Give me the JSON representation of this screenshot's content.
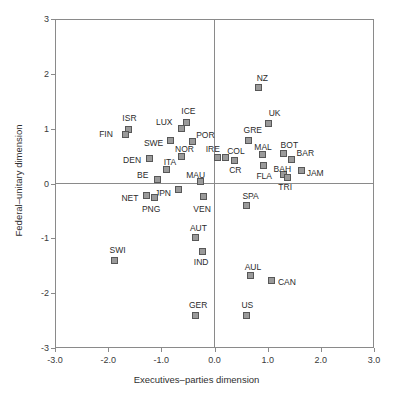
{
  "chart_data": {
    "type": "scatter",
    "title": "",
    "xlabel": "Executives–parties dimension",
    "ylabel": "Federal–unitary dimension",
    "xlim": [
      -3.0,
      3.0
    ],
    "ylim": [
      -3.0,
      3.0
    ],
    "xticks": [
      "-3.0",
      "-2.0",
      "-1.0",
      "0.0",
      "1.0",
      "2.0",
      "3.0"
    ],
    "xtick_values": [
      -3.0,
      -2.0,
      -1.0,
      0.0,
      1.0,
      2.0,
      3.0
    ],
    "yticks": [
      "3",
      "2",
      "1",
      "0",
      "-1",
      "-2",
      "-3"
    ],
    "ytick_values": [
      3,
      2,
      1,
      0,
      -1,
      -2,
      -3
    ],
    "grid": false,
    "legend": "none",
    "marker": {
      "shape": "square",
      "fill": "#9a9a9a",
      "edge": "#575757"
    },
    "reference_lines": {
      "horizontal": 0.0,
      "vertical": 0.0
    },
    "points": [
      {
        "label": "NZ",
        "x": 0.83,
        "y": 1.75,
        "lx": -2,
        "ly": -14
      },
      {
        "label": "UK",
        "x": 1.02,
        "y": 1.1,
        "lx": 0,
        "ly": -14
      },
      {
        "label": "ISR",
        "x": -1.62,
        "y": 0.99,
        "lx": -6,
        "ly": -15
      },
      {
        "label": "FIN",
        "x": -1.68,
        "y": 0.9,
        "lx": -26,
        "ly": -4
      },
      {
        "label": "ICE",
        "x": -0.53,
        "y": 1.12,
        "lx": -5,
        "ly": -15
      },
      {
        "label": "LUX",
        "x": -0.63,
        "y": 1.01,
        "lx": -25,
        "ly": -10
      },
      {
        "label": "POR",
        "x": -0.42,
        "y": 0.76,
        "lx": 4,
        "ly": -11
      },
      {
        "label": "SWE",
        "x": -0.82,
        "y": 0.78,
        "lx": -27,
        "ly": -2
      },
      {
        "label": "GRE",
        "x": 0.64,
        "y": 0.79,
        "lx": -5,
        "ly": -14
      },
      {
        "label": "MAL",
        "x": 0.9,
        "y": 0.52,
        "lx": -8,
        "ly": -12
      },
      {
        "label": "BOT",
        "x": 1.3,
        "y": 0.55,
        "lx": -3,
        "ly": -12
      },
      {
        "label": "BAR",
        "x": 1.45,
        "y": 0.44,
        "lx": 5,
        "ly": -10
      },
      {
        "label": "IRE",
        "x": 0.06,
        "y": 0.48,
        "lx": -12,
        "ly": -12
      },
      {
        "label": "COL",
        "x": 0.2,
        "y": 0.47,
        "lx": 2,
        "ly": -11
      },
      {
        "label": "NOR",
        "x": -0.63,
        "y": 0.5,
        "lx": -6,
        "ly": -11
      },
      {
        "label": "DEN",
        "x": -1.23,
        "y": 0.45,
        "lx": -26,
        "ly": -3
      },
      {
        "label": "ITA",
        "x": -0.9,
        "y": 0.25,
        "lx": -3,
        "ly": -12
      },
      {
        "label": "CR",
        "x": 0.37,
        "y": 0.42,
        "lx": -5,
        "ly": 6
      },
      {
        "label": "FLA",
        "x": 0.92,
        "y": 0.32,
        "lx": -7,
        "ly": 6
      },
      {
        "label": "BAH",
        "x": 1.3,
        "y": 0.17,
        "lx": -10,
        "ly": -9
      },
      {
        "label": "JAM",
        "x": 1.64,
        "y": 0.23,
        "lx": 5,
        "ly": -2
      },
      {
        "label": "TRI",
        "x": 1.37,
        "y": 0.11,
        "lx": -9,
        "ly": 6
      },
      {
        "label": "BE",
        "x": -1.08,
        "y": 0.07,
        "lx": -20,
        "ly": -9
      },
      {
        "label": "MAU",
        "x": -0.27,
        "y": 0.03,
        "lx": -14,
        "ly": -11
      },
      {
        "label": "JPN",
        "x": -0.67,
        "y": -0.11,
        "lx": -24,
        "ly": -1
      },
      {
        "label": "NET",
        "x": -1.28,
        "y": -0.22,
        "lx": -25,
        "ly": -2
      },
      {
        "label": "PNG",
        "x": -1.12,
        "y": -0.26,
        "lx": -13,
        "ly": 7
      },
      {
        "label": "VEN",
        "x": -0.21,
        "y": -0.23,
        "lx": -10,
        "ly": 9
      },
      {
        "label": "SPA",
        "x": 0.6,
        "y": -0.4,
        "lx": -4,
        "ly": -13
      },
      {
        "label": "AUT",
        "x": -0.35,
        "y": -0.98,
        "lx": -6,
        "ly": -13
      },
      {
        "label": "IND",
        "x": -0.22,
        "y": -1.24,
        "lx": -9,
        "ly": 7
      },
      {
        "label": "SWI",
        "x": -1.88,
        "y": -1.4,
        "lx": -5,
        "ly": -14
      },
      {
        "label": "AUL",
        "x": 0.68,
        "y": -1.68,
        "lx": -6,
        "ly": -13
      },
      {
        "label": "CAN",
        "x": 1.08,
        "y": -1.77,
        "lx": 6,
        "ly": -3
      },
      {
        "label": "GER",
        "x": -0.35,
        "y": -2.4,
        "lx": -7,
        "ly": -14
      },
      {
        "label": "US",
        "x": 0.6,
        "y": -2.4,
        "lx": -5,
        "ly": -14
      }
    ]
  }
}
